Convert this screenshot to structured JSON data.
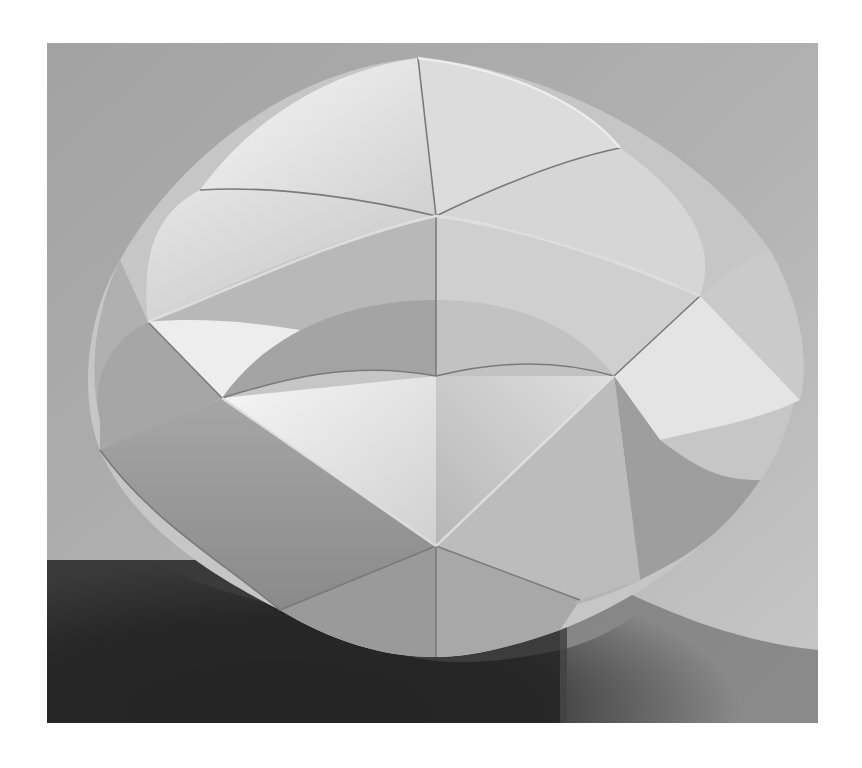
{
  "image": {
    "subject": "folded fabric origami sphere sculpture",
    "style": "black-and-white photograph",
    "frame": {
      "x": 47,
      "y": 43,
      "width": 771,
      "height": 680
    },
    "colors": {
      "page_background": "#ffffff",
      "backdrop_light": "#b4b4b4",
      "backdrop_mid": "#9a9a9a",
      "shadow_dark": "#2a2a2a",
      "fabric_highlight": "#f2f2f2",
      "fabric_light": "#dcdcdc",
      "fabric_mid": "#c4c4c4",
      "fabric_shade": "#a8a8a8",
      "fabric_deep": "#8c8c8c",
      "crease_line": "#6e6e6e"
    },
    "key_points": {
      "top_apex": [
        418,
        58
      ],
      "upper_center_vertex": [
        436,
        216
      ],
      "left_vertex": [
        148,
        322
      ],
      "right_vertex": [
        700,
        296
      ],
      "center_left_vertex": [
        222,
        398
      ],
      "center_right_vertex": [
        614,
        376
      ],
      "lower_center_vertex": [
        436,
        546
      ],
      "bottom_apex": [
        436,
        657
      ]
    }
  }
}
